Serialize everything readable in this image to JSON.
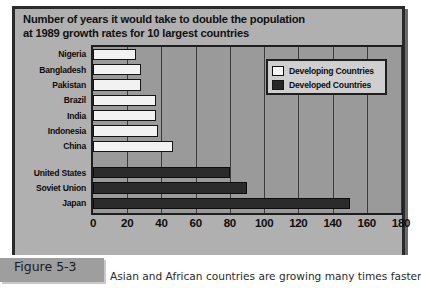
{
  "figure": {
    "tab_label": "Figure 5-3",
    "caption": "Asian and African countries are growing many times faster"
  },
  "chart_data": {
    "type": "bar",
    "orientation": "horizontal",
    "title": "Number of years it would take to double the population at 1989 growth rates for 10 largest countries",
    "title_lines": [
      "Number of years it would take to double the population",
      "at 1989 growth rates for 10 largest countries"
    ],
    "xlabel": "",
    "ylabel": "",
    "xlim": [
      0,
      180
    ],
    "xticks": [
      0,
      20,
      40,
      60,
      80,
      100,
      120,
      140,
      160,
      180
    ],
    "xtick_labels": [
      "0",
      "20",
      "40",
      "60",
      "80",
      "100",
      "120",
      "140",
      "160",
      "180"
    ],
    "grid": true,
    "grid_axis": "x",
    "legend_position": "top-right",
    "categories": [
      "Nigeria",
      "Bangladesh",
      "Pakistan",
      "Brazil",
      "India",
      "Indonesia",
      "China",
      "United States",
      "Soviet Union",
      "Japan"
    ],
    "values": [
      25,
      28,
      28,
      37,
      37,
      38,
      47,
      80,
      90,
      150
    ],
    "groups": [
      "Developing Countries",
      "Developing Countries",
      "Developing Countries",
      "Developing Countries",
      "Developing Countries",
      "Developing Countries",
      "Developing Countries",
      "Developed Countries",
      "Developed Countries",
      "Developed Countries"
    ],
    "series": [
      {
        "name": "Developing Countries",
        "color": "#f2f2f2",
        "points": [
          {
            "category": "Nigeria",
            "value": 25
          },
          {
            "category": "Bangladesh",
            "value": 28
          },
          {
            "category": "Pakistan",
            "value": 28
          },
          {
            "category": "Brazil",
            "value": 37
          },
          {
            "category": "India",
            "value": 37
          },
          {
            "category": "Indonesia",
            "value": 38
          },
          {
            "category": "China",
            "value": 47
          }
        ]
      },
      {
        "name": "Developed Countries",
        "color": "#2b2b2b",
        "points": [
          {
            "category": "United States",
            "value": 80
          },
          {
            "category": "Soviet Union",
            "value": 90
          },
          {
            "category": "Japan",
            "value": 150
          }
        ]
      }
    ],
    "legend": [
      {
        "label": "Developing Countries",
        "color": "#f2f2f2",
        "swatch": "developing"
      },
      {
        "label": "Developed Countries",
        "color": "#2b2b2b",
        "swatch": "developed"
      }
    ]
  },
  "colors": {
    "plot_background": "#9a9a9a",
    "panel_background": "#b0b0b0",
    "frame": "#2a2a2a",
    "developing": "#f2f2f2",
    "developed": "#2b2b2b"
  }
}
